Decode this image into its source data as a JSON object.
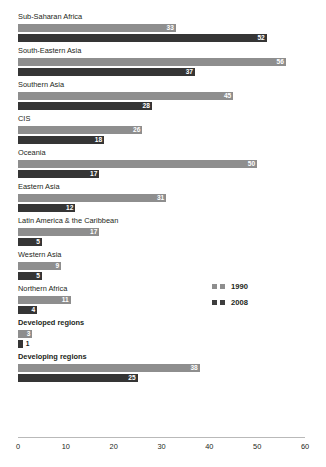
{
  "chart": {
    "clipped_title": "",
    "axis": {
      "ticks": [
        "0",
        "10",
        "20",
        "30",
        "40",
        "50",
        "60"
      ]
    },
    "legend": [
      {
        "label": "1990",
        "color": "#8e8e8e"
      },
      {
        "label": "2008",
        "color": "#3d3d3d"
      }
    ]
  },
  "chart_data": {
    "type": "bar",
    "title": "",
    "xlabel": "",
    "ylabel": "",
    "xlim": [
      0,
      60
    ],
    "grid": false,
    "legend_position": "middle-right",
    "orientation": "horizontal",
    "categories": [
      "Sub-Saharan Africa",
      "South-Eastern Asia",
      "Southern Asia",
      "CIS",
      "Oceania",
      "Eastern Asia",
      "Latin America & the Caribbean",
      "Western Asia",
      "Northern Africa",
      "Developed regions",
      "Developing regions"
    ],
    "aggregate_categories": [
      "Developed regions",
      "Developing regions"
    ],
    "series": [
      {
        "name": "1990",
        "color": "#8e8e8e",
        "values": [
          33,
          56,
          45,
          26,
          50,
          31,
          17,
          9,
          11,
          3,
          38
        ]
      },
      {
        "name": "2008",
        "color": "#3d3d3d",
        "values": [
          52,
          37,
          28,
          18,
          17,
          12,
          5,
          5,
          4,
          1,
          25
        ]
      }
    ],
    "tick_values": [
      0,
      10,
      20,
      30,
      40,
      50,
      60
    ]
  }
}
